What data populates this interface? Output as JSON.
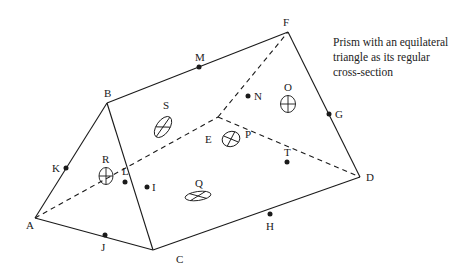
{
  "caption": {
    "lines": [
      "Prism with an equilateral",
      "triangle as its regular",
      "cross-section"
    ]
  },
  "vertices": {
    "A": {
      "label": "A",
      "x": 35,
      "y": 218
    },
    "B": {
      "label": "B",
      "x": 107,
      "y": 103
    },
    "C": {
      "label": "C",
      "x": 153,
      "y": 250
    },
    "D": {
      "label": "D",
      "x": 360,
      "y": 177
    },
    "E": {
      "label": "E",
      "x": 218,
      "y": 117
    },
    "F": {
      "label": "F",
      "x": 288,
      "y": 32
    }
  },
  "edge_points": {
    "M": {
      "label": "M",
      "x": 199,
      "y": 67
    },
    "N": {
      "label": "N",
      "x": 248,
      "y": 96
    },
    "G": {
      "label": "G",
      "x": 329,
      "y": 114
    },
    "K": {
      "label": "K",
      "x": 66,
      "y": 168
    },
    "L": {
      "label": "L",
      "x": 125,
      "y": 182
    },
    "I": {
      "label": "I",
      "x": 147,
      "y": 187
    },
    "J": {
      "label": "J",
      "x": 105,
      "y": 235
    },
    "H": {
      "label": "H",
      "x": 270,
      "y": 214
    },
    "T": {
      "label": "T",
      "x": 287,
      "y": 162
    }
  },
  "face_markers": {
    "S": {
      "label": "S",
      "x": 163,
      "y": 127
    },
    "O": {
      "label": "O",
      "x": 288,
      "y": 104
    },
    "P": {
      "label": "P",
      "x": 231,
      "y": 139
    },
    "R": {
      "label": "R",
      "x": 106,
      "y": 176
    },
    "Q": {
      "label": "Q",
      "x": 198,
      "y": 196
    }
  },
  "colors": {
    "line": "#1a1a1a",
    "background": "#ffffff"
  }
}
